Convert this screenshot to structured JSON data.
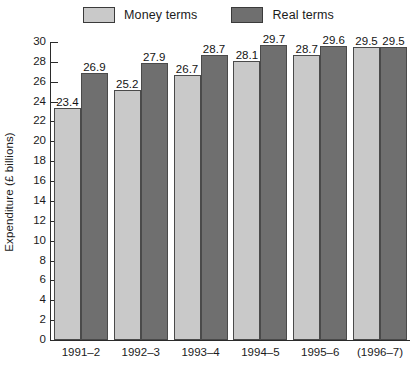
{
  "chart_data": {
    "type": "bar",
    "title": "",
    "xlabel": "",
    "ylabel": "Expenditure (£ billions)",
    "ylim": [
      0,
      30
    ],
    "ytick_step": 2,
    "grid": false,
    "legend_position": "top-center",
    "categories": [
      "1991–2",
      "1992–3",
      "1993–4",
      "1994–5",
      "1995–6",
      "(1996–7)"
    ],
    "series": [
      {
        "name": "Money terms",
        "color": "#c9c9c9",
        "values": [
          23.4,
          25.2,
          26.7,
          28.1,
          28.7,
          29.5
        ],
        "labels": [
          "23.4",
          "25.2",
          "26.7",
          "28.1",
          "28.7",
          "29.5"
        ]
      },
      {
        "name": "Real terms",
        "color": "#6f6f6f",
        "values": [
          26.9,
          27.9,
          28.7,
          29.7,
          29.6,
          29.5
        ],
        "labels": [
          "26.9",
          "27.9",
          "28.7",
          "29.7",
          "29.6",
          "29.5"
        ]
      }
    ],
    "ytick_labels": [
      "30",
      "28",
      "26",
      "24",
      "22",
      "20",
      "18",
      "16",
      "14",
      "12",
      "10",
      "8",
      "6",
      "4",
      "2",
      "0"
    ],
    "ytick_values": [
      30,
      28,
      26,
      24,
      22,
      20,
      18,
      16,
      14,
      12,
      10,
      8,
      6,
      4,
      2,
      0
    ]
  },
  "legend": {
    "items": [
      {
        "label": "Money terms",
        "color": "#c9c9c9"
      },
      {
        "label": "Real terms",
        "color": "#6f6f6f"
      }
    ]
  },
  "axes": {
    "y_title": "Expenditure (£ billions)"
  }
}
